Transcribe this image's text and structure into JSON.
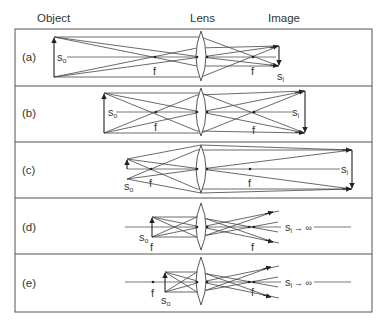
{
  "headers": {
    "object": "Object",
    "lens": "Lens",
    "image": "Image"
  },
  "symbols": {
    "s": "s",
    "o": "o",
    "i": "i",
    "f": "f",
    "to_infinity": "→ ∞"
  },
  "panels": [
    {
      "id": "a",
      "label": "(a)",
      "axis_y": 57,
      "lens": {
        "x": 201,
        "top": 31,
        "bottom": 81
      },
      "object": {
        "x": 54,
        "top": 37,
        "bottom": 77
      },
      "focal_left": 155,
      "focal_right": 253,
      "image": {
        "x": 279,
        "top": 46,
        "bottom": 66,
        "direction": "down"
      },
      "caption": "Object beyond 2f: real, inverted, reduced image"
    },
    {
      "id": "b",
      "label": "(b)",
      "axis_y": 112,
      "lens": {
        "x": 201,
        "top": 88,
        "bottom": 136
      },
      "object": {
        "x": 104,
        "top": 93,
        "bottom": 133
      },
      "focal_left": 156,
      "focal_right": 254,
      "image": {
        "x": 305,
        "top": 91,
        "bottom": 133,
        "direction": "down"
      },
      "caption": "Object at 2f: real, inverted, same-size image"
    },
    {
      "id": "c",
      "label": "(c)",
      "axis_y": 169,
      "lens": {
        "x": 201,
        "top": 145,
        "bottom": 193
      },
      "object": {
        "x": 127,
        "top": 159,
        "bottom": 179
      },
      "focal_left": 151,
      "focal_right": 250,
      "image": {
        "x": 352,
        "top": 150,
        "bottom": 189,
        "direction": "down"
      },
      "caption": "Object between f and 2f: real, inverted, enlarged image"
    },
    {
      "id": "d",
      "label": "(d)",
      "axis_y": 227,
      "lens": {
        "x": 201,
        "top": 203,
        "bottom": 250
      },
      "object": {
        "x": 152,
        "top": 217,
        "bottom": 237
      },
      "focal_left": 152,
      "focal_right": 252,
      "image": null,
      "caption": "Object at f: image at infinity"
    },
    {
      "id": "e",
      "label": "(e)",
      "axis_y": 282,
      "lens": {
        "x": 201,
        "top": 257,
        "bottom": 305
      },
      "object": {
        "x": 165,
        "top": 272,
        "bottom": 292
      },
      "focal_left": 153,
      "focal_right": 252,
      "image": null,
      "caption": "Object inside f: virtual image"
    }
  ],
  "frame": {
    "left": 15,
    "top": 29,
    "right": 372,
    "bottom": 312,
    "dividers": [
      86,
      142,
      198,
      254
    ]
  }
}
